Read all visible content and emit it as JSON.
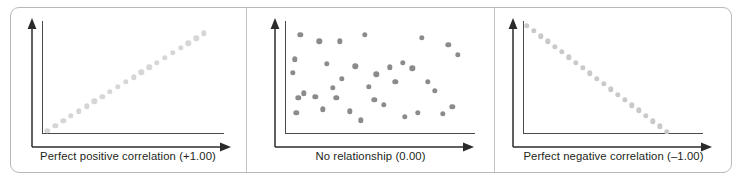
{
  "figure": {
    "background_color": "#ffffff",
    "frame_color": "#b9b9b9",
    "separator_color": "#c3c3c3",
    "axis_color": "#4a4a4a",
    "caption_color": "#231f20"
  },
  "panels": [
    {
      "id": "panel-positive",
      "caption": "Perfect positive correlation (+1.00)",
      "dot_color": "#d6d6d6"
    },
    {
      "id": "panel-none",
      "caption": "No relationship (0.00)",
      "dot_color": "#8b8b8b"
    },
    {
      "id": "panel-negative",
      "caption": "Perfect negative correlation (–1.00)",
      "dot_color": "#c9c9c9"
    }
  ],
  "chart_data": [
    {
      "type": "scatter",
      "title": "Perfect positive correlation (+1.00)",
      "correlation": 1.0,
      "xlabel": "",
      "ylabel": "",
      "xlim": [
        0,
        100
      ],
      "ylim": [
        0,
        100
      ],
      "grid": false,
      "legend": "none",
      "marker_color": "#d6d6d6",
      "marker_size": 5.4,
      "x": [
        3,
        7.3,
        11.6,
        15.9,
        20.2,
        24.5,
        28.8,
        33.1,
        37.4,
        41.7,
        46.0,
        50.3,
        54.6,
        58.9,
        63.2,
        67.5,
        71.8,
        76.1,
        80.4,
        84.7,
        89.0
      ],
      "y": [
        3,
        7.3,
        11.6,
        15.9,
        20.2,
        24.5,
        28.8,
        33.1,
        37.4,
        41.7,
        46.0,
        50.3,
        54.6,
        58.9,
        63.2,
        67.5,
        71.8,
        76.1,
        80.4,
        84.7,
        89.0
      ]
    },
    {
      "type": "scatter",
      "title": "No relationship (0.00)",
      "correlation": 0.0,
      "xlabel": "",
      "ylabel": "",
      "xlim": [
        0,
        100
      ],
      "ylim": [
        0,
        100
      ],
      "grid": false,
      "legend": "none",
      "marker_color": "#8b8b8b",
      "marker_size": 5.4,
      "x": [
        8,
        18,
        29,
        42,
        5,
        22,
        4,
        7,
        55,
        67,
        72,
        86,
        91,
        37,
        48,
        62,
        30,
        10,
        25,
        44,
        58,
        75,
        79,
        16,
        34,
        52,
        70,
        88,
        6,
        20,
        40,
        63,
        83,
        47,
        27
      ],
      "y": [
        88,
        82,
        82,
        88,
        66,
        62,
        54,
        32,
        59,
        58,
        85,
        79,
        70,
        60,
        53,
        63,
        49,
        36,
        41,
        42,
        46,
        46,
        38,
        33,
        20,
        26,
        19,
        24,
        19,
        22,
        12,
        15,
        18,
        30,
        32
      ]
    },
    {
      "type": "scatter",
      "title": "Perfect negative correlation (–1.00)",
      "correlation": -1.0,
      "xlabel": "",
      "ylabel": "",
      "xlim": [
        0,
        100
      ],
      "ylim": [
        0,
        100
      ],
      "grid": false,
      "legend": "none",
      "marker_color": "#c9c9c9",
      "marker_size": 5.4,
      "x": [
        2,
        5.9,
        9.8,
        13.7,
        17.6,
        21.5,
        25.4,
        29.3,
        33.2,
        37.1,
        41.0,
        44.9,
        48.8,
        52.7,
        56.6,
        60.5,
        64.4,
        68.3,
        72.2,
        76.1,
        80.0
      ],
      "y": [
        96,
        91.3,
        86.6,
        81.9,
        77.2,
        72.5,
        67.8,
        63.1,
        58.4,
        53.7,
        49.0,
        44.3,
        39.6,
        34.9,
        30.2,
        25.5,
        20.8,
        16.1,
        11.4,
        6.7,
        2.0
      ]
    }
  ]
}
